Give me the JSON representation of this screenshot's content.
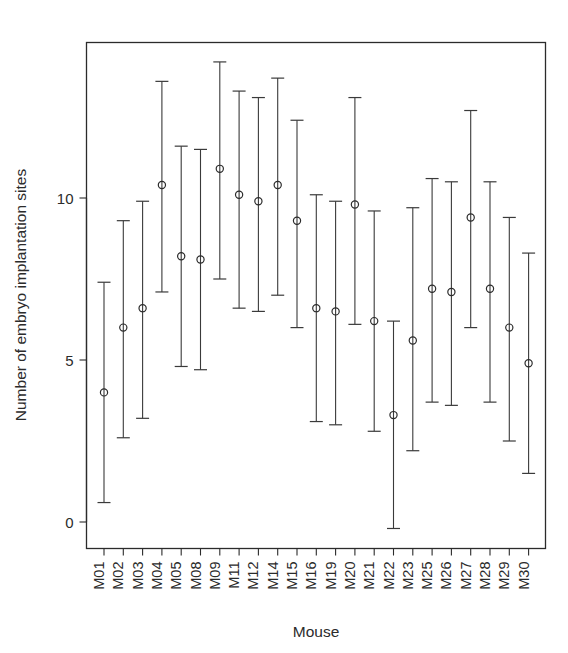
{
  "chart_data": {
    "type": "scatter",
    "title": "",
    "xlabel": "Mouse",
    "ylabel": "Number of embryo implantation sites",
    "categories": [
      "M01",
      "M02",
      "M03",
      "M04",
      "M05",
      "M08",
      "M09",
      "M11",
      "M12",
      "M14",
      "M15",
      "M16",
      "M19",
      "M20",
      "M21",
      "M22",
      "M23",
      "M25",
      "M26",
      "M27",
      "M28",
      "M29",
      "M30"
    ],
    "values": [
      4.0,
      6.0,
      6.6,
      10.4,
      8.2,
      8.1,
      10.9,
      10.1,
      9.9,
      10.4,
      9.3,
      6.6,
      6.5,
      9.8,
      6.2,
      3.3,
      5.6,
      7.2,
      7.1,
      9.4,
      7.2,
      6.0,
      4.9
    ],
    "err_low": [
      0.6,
      2.6,
      3.2,
      7.1,
      4.8,
      4.7,
      7.5,
      6.6,
      6.5,
      7.0,
      6.0,
      3.1,
      3.0,
      6.1,
      2.8,
      -0.2,
      2.2,
      3.7,
      3.6,
      6.0,
      3.7,
      2.5,
      1.5
    ],
    "err_high": [
      7.4,
      9.3,
      9.9,
      13.6,
      11.6,
      11.5,
      14.2,
      13.3,
      13.1,
      13.7,
      12.4,
      10.1,
      9.9,
      13.1,
      9.6,
      6.2,
      9.7,
      10.6,
      10.5,
      12.7,
      10.5,
      9.4,
      8.3
    ],
    "ylim": [
      -0.8,
      14.6
    ],
    "yticks": [
      0,
      5,
      10
    ],
    "ytick_labels": [
      "0",
      "5",
      "10"
    ],
    "grid": false,
    "legend": null,
    "marker": "open-circle",
    "error_bar_style": "capped-vertical",
    "colors": {
      "axis": "#2b2b2b",
      "marker": "#2b2b2b",
      "error_bar": "#3a3a3a",
      "background": "#ffffff"
    }
  }
}
